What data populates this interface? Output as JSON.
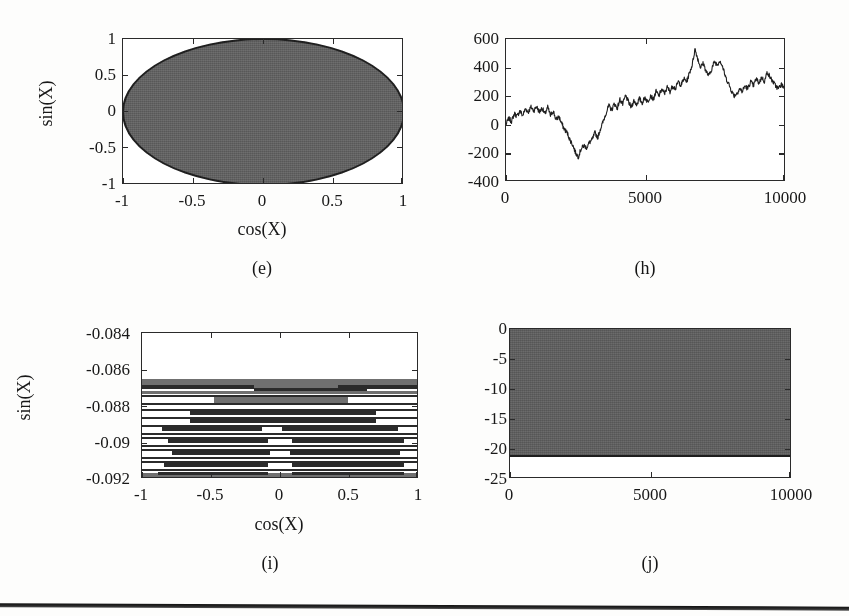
{
  "figure": {
    "background_color": "#fdfdfc",
    "ink_color": "#1b1b1b",
    "fill_gray": "#6e6e6e",
    "panel_count": 4,
    "has_bottom_rule": true
  },
  "panels": [
    {
      "id": "e",
      "caption": "(e)",
      "chart_data": {
        "type": "scatter",
        "title": "",
        "xlabel": "cos(X)",
        "ylabel": "sin(X)",
        "xlim": [
          -1,
          1
        ],
        "ylim": [
          -1,
          1
        ],
        "xticks": [
          "-1",
          "-0.5",
          "0",
          "0.5",
          "1"
        ],
        "xtick_values": [
          -1,
          -0.5,
          0,
          0.5,
          1
        ],
        "yticks": [
          "-1",
          "-0.5",
          "0",
          "0.5",
          "1"
        ],
        "ytick_values": [
          -1,
          -0.5,
          0,
          0.5,
          1
        ],
        "grid": false,
        "legend": "none",
        "description": "Dense scatter of points filling the unit circle (cos(X) vs sin(X)); the interior is solid gray with a dark boundary ring.",
        "shape": "filled-unit-circle",
        "marker_color": "#6e6e6e",
        "edge_color": "#232323"
      }
    },
    {
      "id": "h",
      "caption": "(h)",
      "chart_data": {
        "type": "line",
        "title": "",
        "xlabel": "",
        "ylabel": "",
        "xlim": [
          0,
          10000
        ],
        "ylim": [
          -400,
          600
        ],
        "xticks": [
          "0",
          "5000",
          "10000"
        ],
        "xtick_values": [
          0,
          5000,
          10000
        ],
        "yticks": [
          "-400",
          "-200",
          "0",
          "200",
          "400",
          "600"
        ],
        "ytick_values": [
          -400,
          -200,
          0,
          200,
          400,
          600
        ],
        "grid": false,
        "legend": "none",
        "description": "Cumulative-sum random walk over 10000 steps; rises to ~+120, dips to ~-230 near step 2400, then trends up to a peak ~+540 near step 6800, ending near +260.",
        "line_color": "#1f1f1f",
        "x": [
          0,
          100,
          200,
          300,
          400,
          500,
          600,
          700,
          800,
          900,
          1000,
          1100,
          1200,
          1300,
          1400,
          1500,
          1600,
          1700,
          1800,
          1900,
          2000,
          2100,
          2200,
          2300,
          2400,
          2500,
          2600,
          2700,
          2800,
          2900,
          3000,
          3100,
          3200,
          3300,
          3400,
          3500,
          3600,
          3700,
          3800,
          3900,
          4000,
          4100,
          4200,
          4300,
          4400,
          4500,
          4600,
          4700,
          4800,
          4900,
          5000,
          5100,
          5200,
          5300,
          5400,
          5500,
          5600,
          5700,
          5800,
          5900,
          6000,
          6100,
          6200,
          6300,
          6400,
          6500,
          6600,
          6700,
          6800,
          6900,
          7000,
          7100,
          7200,
          7300,
          7400,
          7500,
          7600,
          7700,
          7800,
          7900,
          8000,
          8100,
          8200,
          8300,
          8400,
          8500,
          8600,
          8700,
          8800,
          8900,
          9000,
          9100,
          9200,
          9300,
          9400,
          9500,
          9600,
          9700,
          9800,
          9900,
          10000
        ],
        "y": [
          0,
          40,
          20,
          75,
          55,
          95,
          60,
          110,
          85,
          120,
          95,
          125,
          85,
          115,
          70,
          120,
          60,
          95,
          30,
          55,
          5,
          -35,
          -60,
          -110,
          -145,
          -200,
          -230,
          -175,
          -150,
          -165,
          -130,
          -110,
          -60,
          -95,
          -30,
          20,
          80,
          130,
          100,
          145,
          110,
          175,
          140,
          200,
          160,
          120,
          165,
          140,
          180,
          150,
          190,
          155,
          205,
          175,
          230,
          200,
          245,
          215,
          260,
          230,
          270,
          250,
          300,
          275,
          320,
          300,
          360,
          420,
          530,
          460,
          400,
          430,
          370,
          340,
          390,
          440,
          420,
          450,
          400,
          330,
          290,
          240,
          200,
          215,
          250,
          230,
          270,
          250,
          300,
          270,
          320,
          290,
          330,
          300,
          370,
          330,
          300,
          270,
          250,
          280,
          260
        ]
      }
    },
    {
      "id": "i",
      "caption": "(i)",
      "chart_data": {
        "type": "scatter",
        "title": "",
        "xlabel": "cos(X)",
        "ylabel": "sin(X)",
        "xlim": [
          -1,
          1
        ],
        "ylim": [
          -0.092,
          -0.084
        ],
        "xticks": [
          "-1",
          "-0.5",
          "0",
          "0.5",
          "1"
        ],
        "xtick_values": [
          -1,
          -0.5,
          0,
          0.5,
          1
        ],
        "yticks": [
          "-0.092",
          "-0.09",
          "-0.088",
          "-0.086",
          "-0.084"
        ],
        "ytick_values": [
          -0.092,
          -0.09,
          -0.088,
          -0.086,
          -0.084
        ],
        "grid": false,
        "legend": "none",
        "description": "Extreme zoom into a narrow sin(X) band: points collapse onto many thin quantised horizontal stripes between -0.0865 and -0.092; the upper region above -0.0865 is empty white.",
        "stripe_color": "#2b2b2b",
        "band_color": "#707070",
        "empty_region_above": -0.0865
      }
    },
    {
      "id": "j",
      "caption": "(j)",
      "chart_data": {
        "type": "area",
        "title": "",
        "xlabel": "",
        "ylabel": "",
        "xlim": [
          0,
          10000
        ],
        "ylim": [
          -25,
          0
        ],
        "xticks": [
          "0",
          "5000",
          "10000"
        ],
        "xtick_values": [
          0,
          5000,
          10000
        ],
        "yticks": [
          "-25",
          "-20",
          "-15",
          "-10",
          "-5",
          "0"
        ],
        "ytick_values": [
          -25,
          -20,
          -15,
          -10,
          -5,
          0
        ],
        "grid": false,
        "legend": "none",
        "description": "Densely oscillating signal over 10000 steps spanning 0 down to about -21.3; the trace fills the band solidly gray with a dark lower envelope, leaving white below -21.5.",
        "fill_color": "#6b6b6b",
        "envelope_color": "#1d1d1d",
        "fill_top": 0,
        "fill_bottom": -21.3
      }
    }
  ]
}
